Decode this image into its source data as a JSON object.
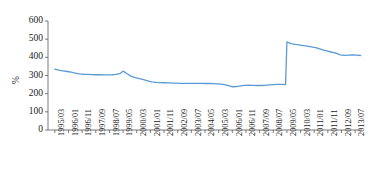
{
  "chart_data": {
    "type": "line",
    "title": "",
    "xlabel": "",
    "ylabel": "%",
    "ylim": [
      0,
      600
    ],
    "yticks": [
      0,
      100,
      200,
      300,
      400,
      500,
      600
    ],
    "grid": false,
    "legend": null,
    "line_color": "#5b9bd5",
    "axis_color": "#595959",
    "xtick_labels": [
      "1995/03",
      "1996/01",
      "1996/11",
      "1997/09",
      "1998/07",
      "1999/05",
      "2000/03",
      "2001/01",
      "2001/11",
      "2002/09",
      "2003/07",
      "2004/05",
      "2005/03",
      "2006/01",
      "2006/11",
      "2007/09",
      "2008/07",
      "2009/05",
      "2010/03",
      "2011/01",
      "2011/11",
      "2012/09",
      "2013/07"
    ],
    "annotations": [
      "Sharp upward level shift at 2009/05 from about 250% to about 485%"
    ],
    "x": [
      "1995/03",
      "1995/06",
      "1995/09",
      "1995/12",
      "1996/03",
      "1996/06",
      "1996/09",
      "1996/12",
      "1997/03",
      "1997/06",
      "1997/09",
      "1997/12",
      "1998/03",
      "1998/06",
      "1998/09",
      "1998/12",
      "1999/03",
      "1999/05",
      "1999/08",
      "1999/11",
      "2000/02",
      "2000/05",
      "2000/08",
      "2000/11",
      "2001/02",
      "2001/05",
      "2001/08",
      "2001/11",
      "2002/02",
      "2002/05",
      "2002/08",
      "2002/11",
      "2003/02",
      "2003/05",
      "2003/08",
      "2003/11",
      "2004/02",
      "2004/05",
      "2004/08",
      "2004/11",
      "2005/02",
      "2005/05",
      "2005/08",
      "2005/11",
      "2006/01",
      "2006/04",
      "2006/07",
      "2006/10",
      "2007/01",
      "2007/04",
      "2007/07",
      "2007/10",
      "2008/01",
      "2008/04",
      "2008/07",
      "2008/10",
      "2009/01",
      "2009/04",
      "2009/05",
      "2009/08",
      "2009/11",
      "2010/02",
      "2010/05",
      "2010/08",
      "2010/11",
      "2011/02",
      "2011/05",
      "2011/08",
      "2011/11",
      "2012/02",
      "2012/05",
      "2012/08",
      "2012/11",
      "2013/02",
      "2013/05",
      "2013/08",
      "2013/11"
    ],
    "values": [
      335,
      330,
      326,
      322,
      318,
      313,
      309,
      307,
      306,
      305,
      304,
      304,
      303,
      303,
      304,
      306,
      312,
      324,
      310,
      295,
      288,
      283,
      277,
      271,
      265,
      262,
      261,
      260,
      259,
      258,
      258,
      257,
      257,
      257,
      257,
      257,
      257,
      256,
      256,
      255,
      254,
      252,
      248,
      243,
      238,
      239,
      243,
      246,
      247,
      246,
      245,
      245,
      246,
      248,
      250,
      251,
      251,
      250,
      485,
      476,
      471,
      468,
      465,
      462,
      458,
      453,
      447,
      440,
      434,
      428,
      423,
      414,
      411,
      412,
      413,
      412,
      410
    ]
  }
}
